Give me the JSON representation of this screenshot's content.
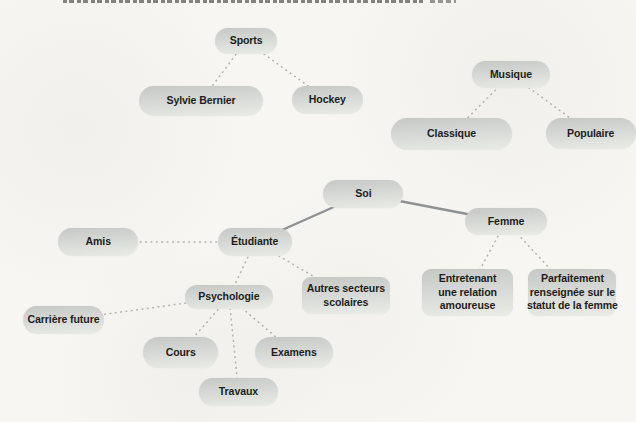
{
  "figure": {
    "kind": "concept-map",
    "language": "fr",
    "colors": {
      "paper": "#f7f6f3",
      "node_top": "#c5c8c4",
      "node_bottom": "#eaece7",
      "ink": "#1e1e1c",
      "dotted_line": "#b2b5b1",
      "solid_line": "#8f9294"
    },
    "nodes": [
      {
        "id": "sports",
        "lines": [
          "Sports"
        ],
        "x": 215,
        "y": 28,
        "w": 62,
        "h": 26,
        "shape": "pill"
      },
      {
        "id": "sylvie-bernier",
        "lines": [
          "Sylvie Bernier"
        ],
        "x": 139,
        "y": 86,
        "w": 124,
        "h": 30,
        "shape": "pill"
      },
      {
        "id": "hockey",
        "lines": [
          "Hockey"
        ],
        "x": 292,
        "y": 86,
        "w": 71,
        "h": 28,
        "shape": "pill"
      },
      {
        "id": "musique",
        "lines": [
          "Musique"
        ],
        "x": 472,
        "y": 61,
        "w": 78,
        "h": 27,
        "shape": "pill"
      },
      {
        "id": "classique",
        "lines": [
          "Classique"
        ],
        "x": 391,
        "y": 118,
        "w": 121,
        "h": 32,
        "shape": "pill"
      },
      {
        "id": "populaire",
        "lines": [
          "Populaire"
        ],
        "x": 546,
        "y": 118,
        "w": 90,
        "h": 31,
        "shape": "pill"
      },
      {
        "id": "soi",
        "lines": [
          "Soi"
        ],
        "x": 323,
        "y": 180,
        "w": 80,
        "h": 28,
        "shape": "pill"
      },
      {
        "id": "femme",
        "lines": [
          "Femme"
        ],
        "x": 465,
        "y": 208,
        "w": 82,
        "h": 27,
        "shape": "pill"
      },
      {
        "id": "etudiante",
        "lines": [
          "Étudiante"
        ],
        "x": 218,
        "y": 228,
        "w": 74,
        "h": 28,
        "shape": "pill"
      },
      {
        "id": "amis",
        "lines": [
          "Amis"
        ],
        "x": 58,
        "y": 228,
        "w": 80,
        "h": 28,
        "shape": "pill"
      },
      {
        "id": "autres-secteurs-scolaires",
        "lines": [
          "Autres secteurs",
          "scolaires"
        ],
        "x": 302,
        "y": 277,
        "w": 88,
        "h": 37,
        "shape": "rect"
      },
      {
        "id": "psychologie",
        "lines": [
          "Psychologie"
        ],
        "x": 185,
        "y": 285,
        "w": 88,
        "h": 24,
        "shape": "pill"
      },
      {
        "id": "carriere-future",
        "lines": [
          "Carrière future"
        ],
        "x": 23,
        "y": 306,
        "w": 81,
        "h": 28,
        "shape": "pill"
      },
      {
        "id": "cours",
        "lines": [
          "Cours"
        ],
        "x": 143,
        "y": 337,
        "w": 75,
        "h": 31,
        "shape": "pill"
      },
      {
        "id": "examens",
        "lines": [
          "Examens"
        ],
        "x": 255,
        "y": 337,
        "w": 78,
        "h": 31,
        "shape": "pill"
      },
      {
        "id": "travaux",
        "lines": [
          "Travaux"
        ],
        "x": 199,
        "y": 378,
        "w": 79,
        "h": 28,
        "shape": "pill"
      },
      {
        "id": "relation-amoureuse",
        "lines": [
          "Entretenant",
          "une relation",
          "amoureuse"
        ],
        "x": 422,
        "y": 269,
        "w": 91,
        "h": 47,
        "shape": "rect"
      },
      {
        "id": "statut-femme",
        "lines": [
          "Parfaitement",
          "renseignée sur le",
          "statut de la femme"
        ],
        "x": 528,
        "y": 269,
        "w": 88,
        "h": 47,
        "shape": "rect"
      }
    ],
    "edges": [
      {
        "from": "soi",
        "to": "etudiante",
        "style": "solid"
      },
      {
        "from": "soi",
        "to": "femme",
        "style": "solid"
      },
      {
        "from": "sports",
        "to": "sylvie-bernier",
        "style": "dotted"
      },
      {
        "from": "sports",
        "to": "hockey",
        "style": "dotted"
      },
      {
        "from": "musique",
        "to": "classique",
        "style": "dotted"
      },
      {
        "from": "musique",
        "to": "populaire",
        "style": "dotted"
      },
      {
        "from": "etudiante",
        "to": "amis",
        "style": "dotted"
      },
      {
        "from": "etudiante",
        "to": "psychologie",
        "style": "dotted"
      },
      {
        "from": "etudiante",
        "to": "autres-secteurs-scolaires",
        "style": "dotted"
      },
      {
        "from": "psychologie",
        "to": "carriere-future",
        "style": "dotted"
      },
      {
        "from": "psychologie",
        "to": "cours",
        "style": "dotted"
      },
      {
        "from": "psychologie",
        "to": "travaux",
        "style": "dotted"
      },
      {
        "from": "psychologie",
        "to": "examens",
        "style": "dotted"
      },
      {
        "from": "femme",
        "to": "relation-amoureuse",
        "style": "dotted"
      },
      {
        "from": "femme",
        "to": "statut-femme",
        "style": "dotted"
      }
    ]
  }
}
